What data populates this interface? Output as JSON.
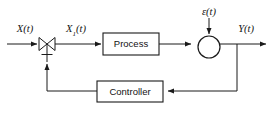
{
  "diagram": {
    "type": "block-diagram",
    "background_color": "#ffffff",
    "line_color": "#1a1a1a",
    "blocks": [
      {
        "id": "process",
        "label": "Process",
        "shape": "rectangle",
        "x": 103,
        "y": 33,
        "w": 56,
        "h": 22
      },
      {
        "id": "controller",
        "label": "Controller",
        "shape": "rectangle",
        "x": 97,
        "y": 81,
        "w": 66,
        "h": 21
      }
    ],
    "nodes": [
      {
        "id": "valve",
        "label": "",
        "shape": "control-valve",
        "cx": 47,
        "cy": 44,
        "r": 8
      },
      {
        "id": "summing",
        "label": "",
        "shape": "summing-junction",
        "cx": 209,
        "cy": 47,
        "r": 11
      }
    ],
    "signals": [
      {
        "id": "x",
        "label": "X(t)",
        "base": "X",
        "sub": "",
        "x": 25,
        "y": 29
      },
      {
        "id": "x1",
        "label": "X1(t)",
        "base": "X",
        "sub": "1",
        "x": 76,
        "y": 29
      },
      {
        "id": "epsilon",
        "label": "ε(t)",
        "base": "ε",
        "sub": "",
        "x": 209,
        "y": 12
      },
      {
        "id": "y",
        "label": "Y(t)",
        "base": "Y",
        "sub": "",
        "x": 246,
        "y": 29
      }
    ],
    "connections": [
      {
        "from": "x-input",
        "to": "valve",
        "direction": "right"
      },
      {
        "from": "valve",
        "to": "process",
        "direction": "right"
      },
      {
        "from": "process",
        "to": "summing",
        "direction": "right"
      },
      {
        "from": "epsilon",
        "to": "summing",
        "direction": "down"
      },
      {
        "from": "summing",
        "to": "y-output",
        "direction": "right"
      },
      {
        "from": "y-branch",
        "to": "controller",
        "direction": "left"
      },
      {
        "from": "controller",
        "to": "valve-stem",
        "direction": "up"
      }
    ]
  }
}
